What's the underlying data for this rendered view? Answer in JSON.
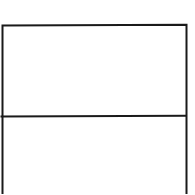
{
  "diagram": {
    "type": "box-with-divider",
    "stroke_color": "#1a1a1a",
    "background_color": "#ffffff",
    "stroke_width": 2,
    "box": {
      "left": 2.5,
      "top": 25.5,
      "right": 186.5,
      "bottom_extends_past_view": true
    },
    "divider": {
      "y": 116.5,
      "x_start": 0.5,
      "x_end": 186.5
    },
    "sections": [
      {
        "name": "top-section",
        "label": ""
      },
      {
        "name": "bottom-section",
        "label": ""
      }
    ]
  }
}
